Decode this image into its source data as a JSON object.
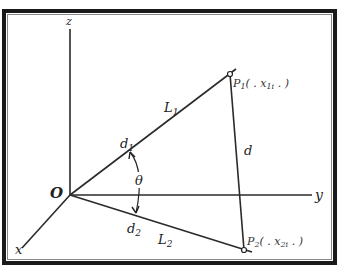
{
  "diagram": {
    "type": "geometric-3d-axes",
    "colors": {
      "frame": "#1a1a1a",
      "line": "#2a2a2a",
      "background": "#ffffff"
    },
    "axes": {
      "z_label": "z",
      "y_label": "y",
      "x_label": "x",
      "origin_label": "O"
    },
    "lines": {
      "l1_label": "L",
      "l1_sub": "1",
      "l2_label": "L",
      "l2_sub": "2",
      "d_label": "d"
    },
    "vectors": {
      "d1_label": "d",
      "d1_sub": "1",
      "d2_label": "d",
      "d2_sub": "2"
    },
    "angle": {
      "label": "θ"
    },
    "points": {
      "p1_label": "P",
      "p1_sub": "1",
      "p1_coords": "( . x",
      "p1_coord_sub": "1i",
      "p1_coords_end": " . )",
      "p2_label": "P",
      "p2_sub": "2",
      "p2_coords": "( . x",
      "p2_coord_sub": "2i",
      "p2_coords_end": " . )"
    }
  }
}
